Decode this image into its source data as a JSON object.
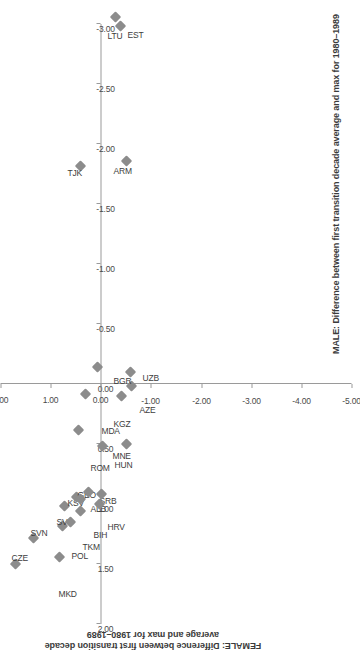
{
  "chart_data": {
    "type": "scatter",
    "title": "",
    "xlabel": "MALE: Difference between first transition decade average and max for 1980–1989",
    "ylabel": "FEMALE: Difference between first transition decade average and max for 1980–1989",
    "xlim": [
      2.0,
      -3.0
    ],
    "ylim": [
      2.0,
      -5.0
    ],
    "xticks": [
      2.0,
      1.5,
      1.0,
      0.5,
      0.0,
      -0.5,
      -1.0,
      -1.5,
      -2.0,
      -2.5,
      -3.0
    ],
    "xtick_labels": [
      "2.00",
      "1.50",
      "1.00",
      "0.50",
      "0.00",
      "-0.50",
      "-1.00",
      "-1.50",
      "-2.00",
      "-2.50",
      "-3.00"
    ],
    "yticks": [
      2.0,
      1.0,
      0.0,
      -1.0,
      -2.0,
      -3.0,
      -4.0,
      -5.0
    ],
    "ytick_labels": [
      "2.00",
      "1.00",
      "0.00",
      "-1.00",
      "-2.00",
      "-3.00",
      "-4.00",
      "-5.00"
    ],
    "grid": false,
    "legend": false,
    "marker": "diamond",
    "marker_color": "#8c8c8c",
    "axis_color": "#9a9a9a",
    "points": [
      {
        "label": "CZE",
        "x": 1.5,
        "y": 1.7,
        "lx": 14,
        "ly": -4
      },
      {
        "label": "SVN",
        "x": 1.28,
        "y": 1.34,
        "lx": 13,
        "ly": -3
      },
      {
        "label": "MKD",
        "x": 1.44,
        "y": 0.83,
        "lx": -28,
        "ly": -1
      },
      {
        "label": "SVK",
        "x": 1.18,
        "y": 0.76,
        "lx": 12,
        "ly": -6
      },
      {
        "label": "POL",
        "x": 1.15,
        "y": 0.6,
        "lx": -26,
        "ly": 1
      },
      {
        "label": "KSV",
        "x": 1.02,
        "y": 0.72,
        "lx": 11,
        "ly": 3
      },
      {
        "label": "GEO",
        "x": 0.94,
        "y": 0.49,
        "lx": 11,
        "ly": 1
      },
      {
        "label": "TKM",
        "x": 1.06,
        "y": 0.4,
        "lx": -27,
        "ly": 2
      },
      {
        "label": "ALB",
        "x": 0.96,
        "y": 0.41,
        "lx": -2,
        "ly": 10
      },
      {
        "label": "SRB",
        "x": 0.9,
        "y": 0.25,
        "lx": -1,
        "ly": 11
      },
      {
        "label": "BIH",
        "x": 1.0,
        "y": 0.03,
        "lx": -24,
        "ly": -6
      },
      {
        "label": "HRV",
        "x": 0.92,
        "y": -0.02,
        "lx": -24,
        "ly": 6
      },
      {
        "label": "HUN",
        "x": 0.52,
        "y": -0.04,
        "lx": -10,
        "ly": 12
      },
      {
        "label": "MNE",
        "x": 0.5,
        "y": -0.52,
        "lx": -3,
        "ly": -14
      },
      {
        "label": "ROM",
        "x": 0.38,
        "y": 0.45,
        "lx": -28,
        "ly": 12
      },
      {
        "label": "MDA",
        "x": 0.08,
        "y": 0.3,
        "lx": -28,
        "ly": 16
      },
      {
        "label": "KGZ",
        "x": 0.1,
        "y": -0.42,
        "lx": -20,
        "ly": -8
      },
      {
        "label": "AZE",
        "x": 0.02,
        "y": -0.62,
        "lx": -16,
        "ly": 8
      },
      {
        "label": "UZB",
        "x": -0.1,
        "y": -0.6,
        "lx": 2,
        "ly": 12
      },
      {
        "label": "BGR",
        "x": -0.14,
        "y": 0.06,
        "lx": -5,
        "ly": 16
      },
      {
        "label": "TJK",
        "x": -1.82,
        "y": 0.4,
        "lx": 0,
        "ly": -13
      },
      {
        "label": "ARM",
        "x": -1.86,
        "y": -0.52,
        "lx": -1,
        "ly": -13
      },
      {
        "label": "LTU",
        "x": -2.98,
        "y": -0.4,
        "lx": -3,
        "ly": -13
      },
      {
        "label": "EST",
        "x": -3.06,
        "y": -0.3,
        "lx": -10,
        "ly": 12
      },
      {
        "label": "LVA",
        "x": -3.58,
        "y": -0.48,
        "lx": -2,
        "ly": 13
      },
      {
        "label": "UKR",
        "x": -3.36,
        "y": -0.94,
        "lx": -1,
        "ly": -13
      },
      {
        "label": "BLR",
        "x": -3.62,
        "y": -1.0,
        "lx": -16,
        "ly": 10
      },
      {
        "label": "RUS",
        "x": -4.34,
        "y": -1.08,
        "lx": -18,
        "ly": -8
      },
      {
        "label": "KAZ",
        "x": -4.02,
        "y": -1.38,
        "lx": -3,
        "ly": -13
      }
    ]
  }
}
